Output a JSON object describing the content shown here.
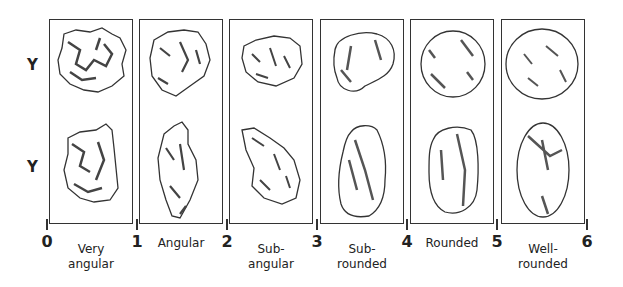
{
  "row_labels": [
    "Y",
    "Y"
  ],
  "scale": {
    "ticks": [
      "0",
      "1",
      "2",
      "3",
      "4",
      "5",
      "6"
    ],
    "categories": [
      {
        "line1": "Very",
        "line2": "angular"
      },
      {
        "line1": "Angular",
        "line2": ""
      },
      {
        "line1": "Sub-",
        "line2": "angular"
      },
      {
        "line1": "Sub-",
        "line2": "rounded"
      },
      {
        "line1": "Rounded",
        "line2": ""
      },
      {
        "line1": "Well-",
        "line2": "rounded"
      }
    ]
  },
  "colors": {
    "line": "#333333",
    "shade": "#555555",
    "background": "#ffffff"
  }
}
